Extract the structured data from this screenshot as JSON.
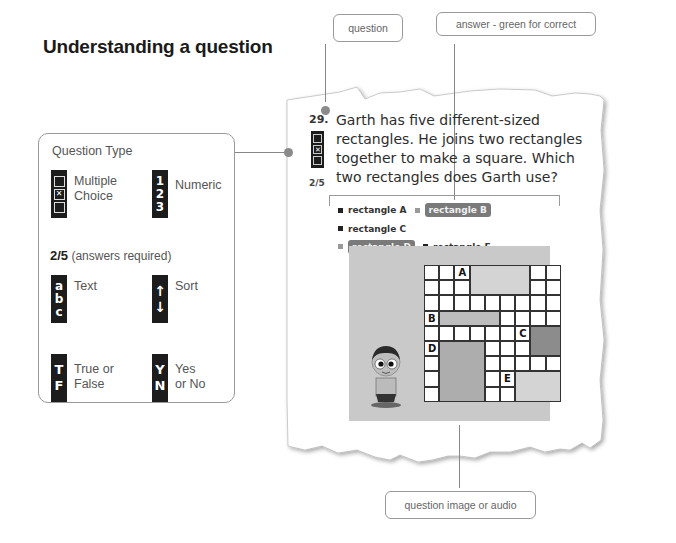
{
  "title": "Understanding a question",
  "callouts": {
    "question": "question",
    "answer": "answer - green for correct",
    "image": "question image or audio"
  },
  "question_type_panel": {
    "title": "Question Type",
    "items": [
      {
        "icon": "multiple-choice-icon",
        "label_line1": "Multiple",
        "label_line2": "Choice"
      },
      {
        "icon": "numeric-icon",
        "glyphs": [
          "1",
          "2",
          "3"
        ],
        "label_line1": "Numeric",
        "label_line2": ""
      },
      {
        "icon": "text-icon",
        "glyphs": [
          "a",
          "b",
          "c"
        ],
        "label_line1": "Text",
        "label_line2": ""
      },
      {
        "icon": "sort-icon",
        "glyphs": [
          "↑",
          "↓"
        ],
        "label_line1": "Sort",
        "label_line2": ""
      },
      {
        "icon": "true-false-icon",
        "glyphs": [
          "T",
          "F"
        ],
        "label_line1": "True or",
        "label_line2": "False"
      },
      {
        "icon": "yes-no-icon",
        "glyphs": [
          "Y",
          "N"
        ],
        "label_line1": "Yes",
        "label_line2": "or No"
      }
    ],
    "answers_required": {
      "fraction": "2/5",
      "note": "(answers required)"
    }
  },
  "question": {
    "number": "29.",
    "text": "Garth has five different-sized rectangles. He joins two rectangles together to make a square. Which two rectangles does Garth use?",
    "fraction": "2/5",
    "answers": [
      {
        "label": "rectangle A",
        "selected": false
      },
      {
        "label": "rectangle B",
        "selected": true
      },
      {
        "label": "rectangle C",
        "selected": false
      },
      {
        "label": "rectangle D",
        "selected": true
      },
      {
        "label": "rectangle E",
        "selected": false
      }
    ]
  },
  "grid": {
    "cols": 9,
    "rows": 9,
    "labels": [
      "A",
      "B",
      "C",
      "D",
      "E"
    ]
  },
  "colors": {
    "selected_answer": "#7a7a7a",
    "line": "#888888",
    "image_bg": "#c9c9c9"
  }
}
